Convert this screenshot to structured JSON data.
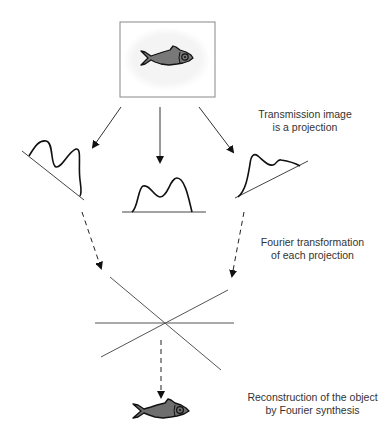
{
  "diagram": {
    "colors": {
      "line": "#222222",
      "thin_line": "#555555",
      "fish_fill": "#777777",
      "fish_outline": "#111111",
      "box_border": "#888888",
      "box_glow": "#f2f2f2",
      "text": "#333333"
    },
    "stages": [
      {
        "id": "object",
        "label": "Object (fish) inside frame"
      },
      {
        "id": "projections",
        "lines": [
          "Transmission image",
          "is a projection"
        ]
      },
      {
        "id": "fourier",
        "lines": [
          "Fourier transformation",
          "of each projection"
        ]
      },
      {
        "id": "reconstruction",
        "lines": [
          "Reconstruction of the object",
          "by Fourier synthesis"
        ]
      }
    ],
    "projections": [
      {
        "name": "left-projection",
        "angle": "oblique-left"
      },
      {
        "name": "center-projection",
        "angle": "vertical"
      },
      {
        "name": "right-projection",
        "angle": "oblique-right"
      }
    ],
    "fourier_lines_count": 3
  }
}
